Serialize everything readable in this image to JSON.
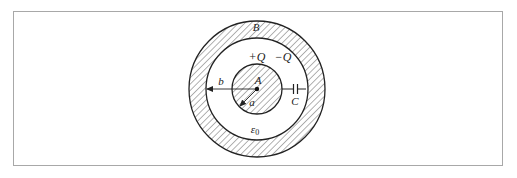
{
  "figure": {
    "colors": {
      "stroke": "#222222",
      "hatch": "#555555",
      "frame": "#a8a8a8",
      "background": "#ffffff"
    },
    "labels": {
      "outer_shell": "B",
      "inner_sphere": "A",
      "inner_charge": "+Q",
      "outer_charge": "−Q",
      "outer_radius": "b",
      "inner_radius": "a",
      "capacitor": "C",
      "permittivity_symbol": "ε",
      "permittivity_subscript": "0"
    },
    "geometry": {
      "center": [
        257,
        89
      ],
      "inner_sphere_radius": 25,
      "shell_inner_radius": 51,
      "shell_outer_radius": 68
    }
  }
}
